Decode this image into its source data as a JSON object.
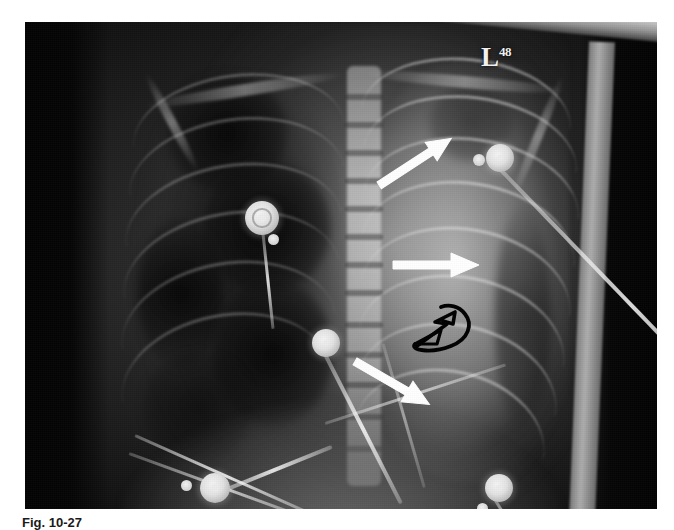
{
  "figure": {
    "caption": "Fig. 10-27",
    "modality": "chest-radiograph",
    "view": "anteroposterior"
  },
  "radiograph": {
    "side_marker": {
      "letter": "L",
      "superscript": "48",
      "meaning": "left-side-marker"
    },
    "background_color": "#050505",
    "film_tone_light": "#d8d8d8",
    "film_tone_mid": "#8f8f8f",
    "film_tone_dark": "#0c0c0c"
  },
  "annotations": {
    "white_arrows": [
      {
        "name": "arrow-upper",
        "label": "solid white arrow pointing upper-right",
        "x": 388,
        "y": 158,
        "angle": -32,
        "length": 70,
        "color": "#ffffff"
      },
      {
        "name": "arrow-middle",
        "label": "solid white arrow pointing right",
        "x": 396,
        "y": 259,
        "angle": 0,
        "length": 76,
        "color": "#ffffff"
      },
      {
        "name": "arrow-lower",
        "label": "solid white arrow pointing lower-right",
        "x": 360,
        "y": 358,
        "angle": 30,
        "length": 76,
        "color": "#ffffff"
      }
    ],
    "open_arrow": {
      "name": "open-curved-arrow",
      "label": "black open curved arrow pointing lower-left",
      "x": 412,
      "y": 300,
      "color": "#000000"
    }
  },
  "devices": {
    "electrodes": [
      {
        "name": "electrode-upper-left",
        "cx": 237,
        "cy": 196,
        "r": 17
      },
      {
        "name": "electrode-upper-right",
        "cx": 475,
        "cy": 136,
        "r": 14
      },
      {
        "name": "electrode-central",
        "cx": 301,
        "cy": 321,
        "r": 14
      },
      {
        "name": "electrode-lower-left",
        "cx": 190,
        "cy": 466,
        "r": 15
      },
      {
        "name": "electrode-lower-right",
        "cx": 474,
        "cy": 466,
        "r": 14
      }
    ],
    "lead_wire_count": 5,
    "lead_wire_label": "ECG monitoring lead wires"
  },
  "anatomy": {
    "regions": [
      {
        "name": "left-hemithorax-lucent",
        "description": "hyperlucent dark lung field (image left)"
      },
      {
        "name": "right-hemithorax-opaque",
        "description": "opacified hemithorax with visible ribs (image right)"
      },
      {
        "name": "thoracic-spine",
        "description": "midline vertebral column"
      },
      {
        "name": "diaphragm",
        "description": "diaphragm and upper abdominal shadow"
      }
    ]
  }
}
